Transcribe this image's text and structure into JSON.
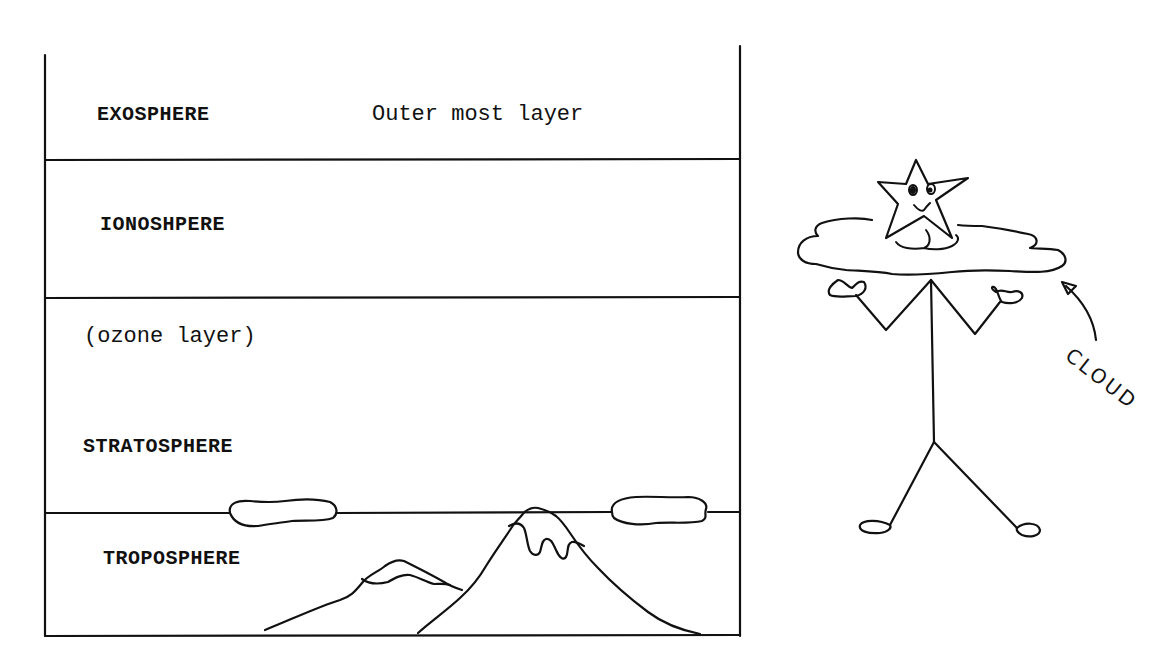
{
  "diagram": {
    "layers": [
      {
        "name": "EXOSPHERE",
        "note": "Outer most layer"
      },
      {
        "name": "IONOSHPERE"
      },
      {
        "name": "STRATOSPHERE",
        "note": "(ozone layer)"
      },
      {
        "name": "TROPOSPHERE"
      }
    ],
    "figure": {
      "character": "star-headed stick figure",
      "annotation": "CLOUD"
    }
  }
}
